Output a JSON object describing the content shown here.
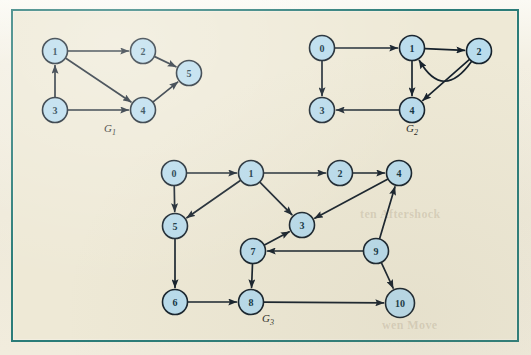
{
  "figure": {
    "background_color": "#eee9d6",
    "frame_color": "#2b7c78",
    "node_fill": "#b9dced",
    "node_stroke": "#16222c",
    "edge_color": "#15202b"
  },
  "ghost_marks": [
    {
      "text": "ten Aftershock",
      "x": 360,
      "y": 207
    },
    {
      "text": "wen Move",
      "x": 382,
      "y": 318
    }
  ],
  "graphs": [
    {
      "id": "G1",
      "caption": "G",
      "caption_sub": "1",
      "caption_x": 110,
      "caption_y": 132,
      "nodes": [
        {
          "id": "1",
          "label": "1",
          "x": 55,
          "y": 51
        },
        {
          "id": "2",
          "label": "2",
          "x": 143,
          "y": 51
        },
        {
          "id": "5",
          "label": "5",
          "x": 189,
          "y": 73
        },
        {
          "id": "3",
          "label": "3",
          "x": 55,
          "y": 110
        },
        {
          "id": "4",
          "label": "4",
          "x": 143,
          "y": 110
        }
      ],
      "edges": [
        {
          "from": "1",
          "to": "2"
        },
        {
          "from": "2",
          "to": "5"
        },
        {
          "from": "1",
          "to": "4"
        },
        {
          "from": "3",
          "to": "1"
        },
        {
          "from": "3",
          "to": "4"
        },
        {
          "from": "4",
          "to": "5"
        }
      ]
    },
    {
      "id": "G2",
      "caption": "G",
      "caption_sub": "2",
      "caption_x": 412,
      "caption_y": 132,
      "nodes": [
        {
          "id": "0",
          "label": "0",
          "x": 322,
          "y": 48
        },
        {
          "id": "1",
          "label": "1",
          "x": 412,
          "y": 48
        },
        {
          "id": "2",
          "label": "2",
          "x": 479,
          "y": 51
        },
        {
          "id": "3",
          "label": "3",
          "x": 322,
          "y": 110
        },
        {
          "id": "4",
          "label": "4",
          "x": 412,
          "y": 110
        }
      ],
      "edges": [
        {
          "from": "0",
          "to": "1"
        },
        {
          "from": "0",
          "to": "3"
        },
        {
          "from": "1",
          "to": "2"
        },
        {
          "from": "1",
          "to": "4"
        },
        {
          "from": "2",
          "to": "1",
          "curve": -26
        },
        {
          "from": "2",
          "to": "4"
        },
        {
          "from": "4",
          "to": "3"
        }
      ]
    },
    {
      "id": "G3",
      "caption": "G",
      "caption_sub": "3",
      "caption_x": 268,
      "caption_y": 322,
      "nodes": [
        {
          "id": "0",
          "label": "0",
          "x": 174,
          "y": 173
        },
        {
          "id": "1",
          "label": "1",
          "x": 251,
          "y": 173
        },
        {
          "id": "2",
          "label": "2",
          "x": 340,
          "y": 173
        },
        {
          "id": "4",
          "label": "4",
          "x": 399,
          "y": 173
        },
        {
          "id": "5",
          "label": "5",
          "x": 175,
          "y": 226
        },
        {
          "id": "3",
          "label": "3",
          "x": 302,
          "y": 225
        },
        {
          "id": "7",
          "label": "7",
          "x": 253,
          "y": 251
        },
        {
          "id": "9",
          "label": "9",
          "x": 376,
          "y": 251
        },
        {
          "id": "6",
          "label": "6",
          "x": 175,
          "y": 302
        },
        {
          "id": "8",
          "label": "8",
          "x": 251,
          "y": 302
        },
        {
          "id": "10",
          "label": "10",
          "x": 400,
          "y": 303
        }
      ],
      "edges": [
        {
          "from": "0",
          "to": "1"
        },
        {
          "from": "0",
          "to": "5"
        },
        {
          "from": "1",
          "to": "2"
        },
        {
          "from": "1",
          "to": "5"
        },
        {
          "from": "1",
          "to": "3"
        },
        {
          "from": "2",
          "to": "4"
        },
        {
          "from": "4",
          "to": "3"
        },
        {
          "from": "5",
          "to": "6"
        },
        {
          "from": "6",
          "to": "8"
        },
        {
          "from": "7",
          "to": "3"
        },
        {
          "from": "7",
          "to": "8"
        },
        {
          "from": "8",
          "to": "10"
        },
        {
          "from": "9",
          "to": "4"
        },
        {
          "from": "9",
          "to": "7"
        },
        {
          "from": "9",
          "to": "10"
        }
      ]
    }
  ]
}
